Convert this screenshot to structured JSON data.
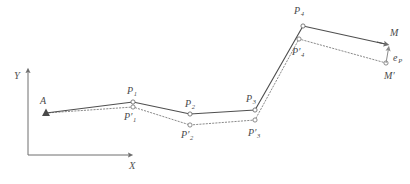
{
  "figure": {
    "background_color": "#ffffff",
    "solid_line_color": "#4f4f4f",
    "dotted_line_color": "#8a8a8a",
    "axis_color": "#6e6e6e",
    "label_color": "#4a4a4a",
    "marker_fill": "#ffffff",
    "marker_stroke": "#6e6e6e"
  },
  "axes": {
    "x_label": "X",
    "y_label": "Y",
    "origin": {
      "x": 28,
      "y": 155
    },
    "x_end": {
      "x": 135,
      "y": 155
    },
    "y_end": {
      "x": 28,
      "y": 66
    },
    "x_label_pos": {
      "x": 129,
      "y": 161
    },
    "y_label_pos": {
      "x": 14,
      "y": 71
    }
  },
  "solid_path": {
    "name": "measured-polyline",
    "style": "solid",
    "points": [
      {
        "label": "A",
        "x": 46,
        "y": 113,
        "marker": "triangle"
      },
      {
        "label": "P1",
        "x": 133,
        "y": 102,
        "marker": "circle"
      },
      {
        "label": "P2",
        "x": 190,
        "y": 114,
        "marker": "circle"
      },
      {
        "label": "P3",
        "x": 255,
        "y": 110,
        "marker": "circle"
      },
      {
        "label": "P4",
        "x": 303,
        "y": 26,
        "marker": "circle"
      },
      {
        "label": "M",
        "x": 389,
        "y": 44,
        "marker": "triangle"
      }
    ]
  },
  "dotted_path": {
    "name": "offset-polyline",
    "style": "dotted",
    "points": [
      {
        "label": "A",
        "x": 46,
        "y": 113,
        "marker": "triangle"
      },
      {
        "label": "P'1",
        "x": 133,
        "y": 107,
        "marker": "circle"
      },
      {
        "label": "P'2",
        "x": 190,
        "y": 125,
        "marker": "circle"
      },
      {
        "label": "P'3",
        "x": 255,
        "y": 120,
        "marker": "circle"
      },
      {
        "label": "P'4",
        "x": 299,
        "y": 39,
        "marker": "circle"
      },
      {
        "label": "M'",
        "x": 386,
        "y": 63,
        "marker": "circle"
      }
    ]
  },
  "deviation_vector": {
    "name": "e_P",
    "from": {
      "label": "M'",
      "x": 386,
      "y": 63
    },
    "to": {
      "label": "M",
      "x": 389,
      "y": 44
    },
    "label": "e",
    "subscript": "P"
  },
  "point_labels": [
    {
      "id": "A",
      "base": "A",
      "prime": false,
      "sub": "",
      "x": 40,
      "y": 96,
      "name": "point-label-a"
    },
    {
      "id": "P1",
      "base": "P",
      "prime": false,
      "sub": "1",
      "x": 127,
      "y": 86,
      "name": "point-label-p1"
    },
    {
      "id": "P2",
      "base": "P",
      "prime": false,
      "sub": "2",
      "x": 185,
      "y": 99,
      "name": "point-label-p2"
    },
    {
      "id": "P3",
      "base": "P",
      "prime": false,
      "sub": "3",
      "x": 246,
      "y": 94,
      "name": "point-label-p3"
    },
    {
      "id": "P4",
      "base": "P",
      "prime": false,
      "sub": "4",
      "x": 294,
      "y": 6,
      "name": "point-label-p4"
    },
    {
      "id": "M",
      "base": "M",
      "prime": false,
      "sub": "",
      "x": 390,
      "y": 28,
      "name": "point-label-m"
    },
    {
      "id": "Pp1",
      "base": "P",
      "prime": true,
      "sub": "1",
      "x": 124,
      "y": 112,
      "name": "point-label-p1-prime"
    },
    {
      "id": "Pp2",
      "base": "P",
      "prime": true,
      "sub": "2",
      "x": 181,
      "y": 130,
      "name": "point-label-p2-prime"
    },
    {
      "id": "Pp3",
      "base": "P",
      "prime": true,
      "sub": "3",
      "x": 248,
      "y": 128,
      "name": "point-label-p3-prime"
    },
    {
      "id": "Pp4",
      "base": "P",
      "prime": true,
      "sub": "4",
      "x": 292,
      "y": 47,
      "name": "point-label-p4-prime"
    },
    {
      "id": "Mp",
      "base": "M",
      "prime": true,
      "sub": "",
      "x": 384,
      "y": 71,
      "name": "point-label-m-prime"
    }
  ],
  "ep_label": {
    "base": "e",
    "sub": "P",
    "x": 393,
    "y": 53
  }
}
